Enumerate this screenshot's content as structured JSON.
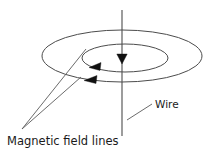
{
  "figure": {
    "background_color": "#ffffff",
    "line_color": "#4c4c4c",
    "arrow_color": "#111111",
    "text_color": "#1a1a1a",
    "width": 211,
    "height": 150
  },
  "labels": {
    "magnetic_field_lines": "Magnetic field lines",
    "wire": "Wire"
  },
  "diagram": {
    "wire": {
      "name": "vertical current-carrying wire",
      "x": 122,
      "y_top": 10,
      "y_bottom": 136,
      "current_direction": "downward"
    },
    "current_arrow": {
      "direction": "down",
      "x": 122,
      "y": 62
    },
    "field_loops": [
      {
        "name": "inner field line",
        "cx": 125,
        "cy": 58,
        "rx": 43,
        "ry": 14,
        "arrow_direction": "left",
        "arrow_x": 97,
        "arrow_y": 68
      },
      {
        "name": "outer field line",
        "cx": 122,
        "cy": 56,
        "rx": 80,
        "ry": 26,
        "arrow_direction": "left",
        "arrow_x": 92,
        "arrow_y": 80
      }
    ],
    "leaders": {
      "field_label_anchor": {
        "x": 22,
        "y": 129
      },
      "field_line_targets": [
        {
          "x": 86,
          "y": 49
        },
        {
          "x": 80,
          "y": 77
        }
      ],
      "wire_label_leader": {
        "x1": 128,
        "y1": 119,
        "x2": 152,
        "y2": 104
      }
    }
  }
}
